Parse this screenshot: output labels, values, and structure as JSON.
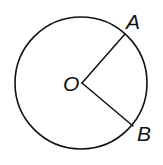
{
  "diagram": {
    "stroke_color": "#111111",
    "background": "#ffffff",
    "circle": {
      "center": [
        81,
        83
      ],
      "radius": 66
    },
    "points": {
      "O": {
        "label": "O",
        "x": 82,
        "y": 83
      },
      "A": {
        "label": "A",
        "x": 125,
        "y": 34
      },
      "B": {
        "label": "B",
        "x": 133,
        "y": 126
      }
    },
    "segments": [
      {
        "from": "O",
        "to": "A"
      },
      {
        "from": "O",
        "to": "B"
      }
    ]
  }
}
